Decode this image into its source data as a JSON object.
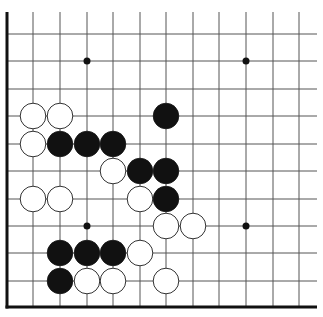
{
  "board": {
    "title": "Go board diagram (lower-left corner)",
    "colors": {
      "line": "#555555",
      "edge": "#111111",
      "black": "#111111",
      "white": "#ffffff",
      "background": "#ffffff"
    },
    "columns_x": [
      7,
      33,
      60,
      87,
      113,
      140,
      166,
      193,
      219,
      246,
      273,
      299
    ],
    "rows_y": [
      34,
      61,
      89,
      116,
      144,
      171,
      199,
      226,
      253,
      281,
      307
    ],
    "top_y": 12,
    "right_x": 317,
    "star_points": [
      [
        3,
        1
      ],
      [
        9,
        1
      ],
      [
        3,
        7
      ],
      [
        9,
        7
      ]
    ],
    "stones": [
      {
        "color": "white",
        "col": 1,
        "row": 3
      },
      {
        "color": "white",
        "col": 2,
        "row": 3
      },
      {
        "color": "black",
        "col": 6,
        "row": 3
      },
      {
        "color": "white",
        "col": 1,
        "row": 4
      },
      {
        "color": "black",
        "col": 2,
        "row": 4
      },
      {
        "color": "black",
        "col": 3,
        "row": 4
      },
      {
        "color": "black",
        "col": 4,
        "row": 4
      },
      {
        "color": "white",
        "col": 4,
        "row": 5
      },
      {
        "color": "black",
        "col": 5,
        "row": 5
      },
      {
        "color": "black",
        "col": 6,
        "row": 5
      },
      {
        "color": "white",
        "col": 1,
        "row": 6
      },
      {
        "color": "white",
        "col": 2,
        "row": 6
      },
      {
        "color": "white",
        "col": 5,
        "row": 6
      },
      {
        "color": "black",
        "col": 6,
        "row": 6
      },
      {
        "color": "white",
        "col": 6,
        "row": 7
      },
      {
        "color": "white",
        "col": 7,
        "row": 7
      },
      {
        "color": "black",
        "col": 2,
        "row": 8
      },
      {
        "color": "black",
        "col": 3,
        "row": 8
      },
      {
        "color": "black",
        "col": 4,
        "row": 8
      },
      {
        "color": "white",
        "col": 5,
        "row": 8
      },
      {
        "color": "black",
        "col": 2,
        "row": 9
      },
      {
        "color": "white",
        "col": 3,
        "row": 9
      },
      {
        "color": "white",
        "col": 4,
        "row": 9
      },
      {
        "color": "white",
        "col": 6,
        "row": 9
      }
    ]
  }
}
